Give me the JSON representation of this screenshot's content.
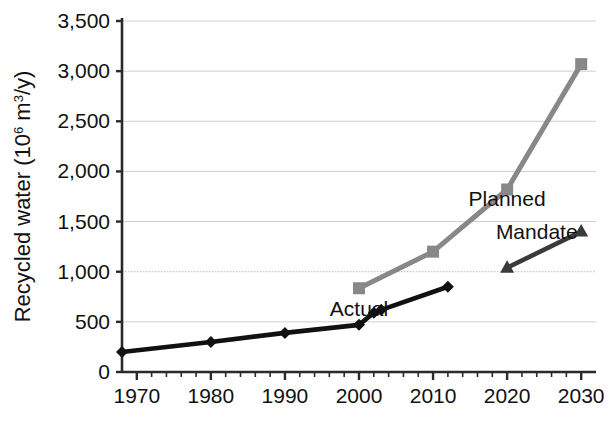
{
  "chart_data": {
    "type": "line",
    "title": "",
    "xlabel": "",
    "ylabel": "Recycled water (10⁶ m³/y)",
    "ylabel_main": "Recycled water (10",
    "ylabel_sup": "6",
    "ylabel_tail": " m",
    "ylabel_sup2": "3",
    "ylabel_tail2": "/y)",
    "xlim": [
      1968,
      2032
    ],
    "ylim": [
      0,
      3500
    ],
    "grid": true,
    "legend_position": "inline-annotations",
    "x_ticks": [
      1970,
      1980,
      1990,
      2000,
      2010,
      2020,
      2030
    ],
    "x_tick_labels": [
      "1970",
      "1980",
      "1990",
      "2000",
      "2010",
      "2020",
      "2030"
    ],
    "x_minor_tick_step": 2,
    "y_ticks": [
      0,
      500,
      1000,
      1500,
      2000,
      2500,
      3000,
      3500
    ],
    "y_tick_labels": [
      "0",
      "500",
      "1,000",
      "1,500",
      "2,000",
      "2,500",
      "3,000",
      "3,500"
    ],
    "series": [
      {
        "name": "Actual",
        "color": "#111111",
        "marker": "diamond",
        "label_x": 2000,
        "label_y": 560,
        "x": [
          1968,
          1980,
          1990,
          2000,
          2002,
          2003,
          2012
        ],
        "values": [
          200,
          300,
          390,
          470,
          590,
          620,
          850
        ]
      },
      {
        "name": "Planned",
        "color": "#888888",
        "marker": "square",
        "label_x": 2020,
        "label_y": 1660,
        "x": [
          2000,
          2010,
          2020,
          2030
        ],
        "values": [
          835,
          1200,
          1820,
          3070
        ]
      },
      {
        "name": "Mandate",
        "color": "#3a3a3a",
        "marker": "triangle",
        "label_x": 2024,
        "label_y": 1330,
        "x": [
          2020,
          2030
        ],
        "values": [
          1040,
          1400
        ]
      }
    ]
  }
}
